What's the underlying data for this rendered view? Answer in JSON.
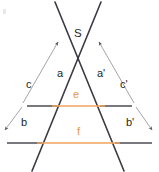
{
  "figure": {
    "kind": "geometry-diagram",
    "width": 159,
    "height": 172,
    "background": "#ffffff",
    "colors": {
      "ray": "#3a3a42",
      "transversal_outer": "#4b4b53",
      "transversal_inner": "#f0a45e",
      "thin_measure": "#9a9aa2",
      "label": "#231f20",
      "label_orange": "#e8954a",
      "corner_mark": "#e9e9ea"
    },
    "vertex": {
      "name": "S",
      "label": "S",
      "x": 78,
      "y": 52
    },
    "rays": [
      {
        "name": "left-ray",
        "x1": 55,
        "y1": 2,
        "x2": 124,
        "y2": 171
      },
      {
        "name": "right-ray",
        "x1": 101,
        "y1": 2,
        "x2": 32,
        "y2": 171
      }
    ],
    "transversals": [
      {
        "name": "line-e",
        "label": "e",
        "label_color": "#e8954a",
        "y": 106,
        "x_start": 27,
        "x_end": 132,
        "inner_x_start": 56,
        "inner_x_end": 101,
        "label_x": 75,
        "label_y": 92
      },
      {
        "name": "line-f",
        "label": "f",
        "label_color": "#e8954a",
        "y": 143,
        "x_start": 7,
        "x_end": 152,
        "inner_x_start": 41,
        "inner_x_end": 116,
        "label_x": 78,
        "label_y": 128
      }
    ],
    "measure_arrows": [
      {
        "name": "measure-c",
        "label": "c",
        "label_x": 27,
        "label_y": 83,
        "x1": 23,
        "y1": 103,
        "x2": 58,
        "y2": 42,
        "arrow_at": "end"
      },
      {
        "name": "measure-c-prime",
        "label": "c'",
        "label_x": 121,
        "label_y": 83,
        "x1": 134,
        "y1": 103,
        "x2": 99,
        "y2": 42,
        "arrow_at": "end"
      },
      {
        "name": "measure-b",
        "label": "b",
        "label_x": 22,
        "label_y": 122,
        "x1": 21,
        "y1": 106,
        "x2": 5,
        "y2": 130,
        "arrow_at": "end"
      },
      {
        "name": "measure-b-prime",
        "label": "b'",
        "label_x": 127,
        "label_y": 122,
        "x1": 137,
        "y1": 106,
        "x2": 152,
        "y2": 130,
        "arrow_at": "end"
      }
    ],
    "segment_labels": [
      {
        "name": "label-a",
        "label": "a",
        "x": 57,
        "y": 73
      },
      {
        "name": "label-a-prime",
        "label": "a'",
        "x": 97,
        "y": 73
      }
    ],
    "corner_mark": {
      "name": "corner-mark",
      "visible": true
    }
  }
}
